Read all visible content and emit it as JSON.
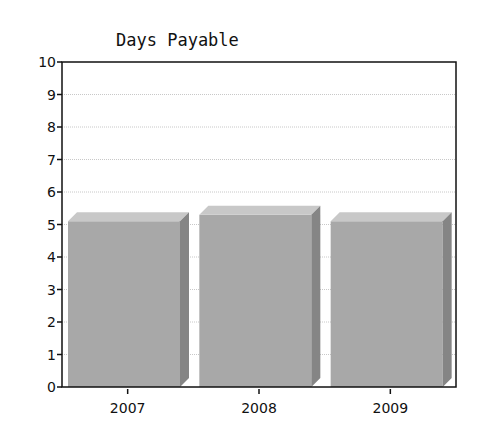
{
  "chart_data": {
    "type": "bar",
    "title": "Days Payable",
    "xlabel": "",
    "ylabel": "",
    "categories": [
      "2007",
      "2008",
      "2009"
    ],
    "values": [
      5.1,
      5.3,
      5.1
    ],
    "ylim": [
      0,
      10
    ],
    "yticks": [
      0,
      1,
      2,
      3,
      4,
      5,
      6,
      7,
      8,
      9,
      10
    ],
    "grid": true,
    "legend": null,
    "style": "3d",
    "colors": {
      "front": "#a8a8a8",
      "top": "#c8c8c8",
      "side": "#858585",
      "grid": "#c8c8c8",
      "axis": "#111111"
    }
  }
}
